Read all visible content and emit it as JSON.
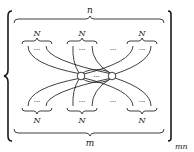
{
  "diagram": {
    "outer_label_bottom_right": "mn",
    "top_brace_label": "n",
    "bottom_brace_label": "m",
    "top_groups": [
      {
        "label": "N",
        "ellipsis": "···"
      },
      {
        "label": "N",
        "ellipsis": "···"
      },
      {
        "label": "N",
        "ellipsis": "···"
      }
    ],
    "top_between_ellipsis": "···",
    "bottom_groups": [
      {
        "label": "N",
        "ellipsis": "···"
      },
      {
        "label": "N",
        "ellipsis": "···"
      },
      {
        "label": "N",
        "ellipsis": "···"
      }
    ],
    "bottom_between_ellipsis": "···",
    "center_nodes_ellipsis": "···"
  }
}
